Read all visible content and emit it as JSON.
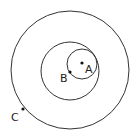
{
  "diagram": {
    "stroke_color": "#333333",
    "circles": [
      {
        "name": "outer-circle",
        "cx": 70,
        "cy": 70,
        "r": 59
      },
      {
        "name": "middle-circle",
        "cx": 70,
        "cy": 71,
        "r": 29
      },
      {
        "name": "inner-circle",
        "cx": 82,
        "cy": 64,
        "r": 15
      }
    ],
    "points": [
      {
        "label": "A",
        "x": 82,
        "y": 63,
        "lx": 85,
        "ly": 73
      },
      {
        "label": "B",
        "x": 70,
        "y": 72,
        "lx": 60,
        "ly": 82
      },
      {
        "label": "C",
        "x": 23,
        "y": 109,
        "lx": 11,
        "ly": 121
      }
    ]
  }
}
